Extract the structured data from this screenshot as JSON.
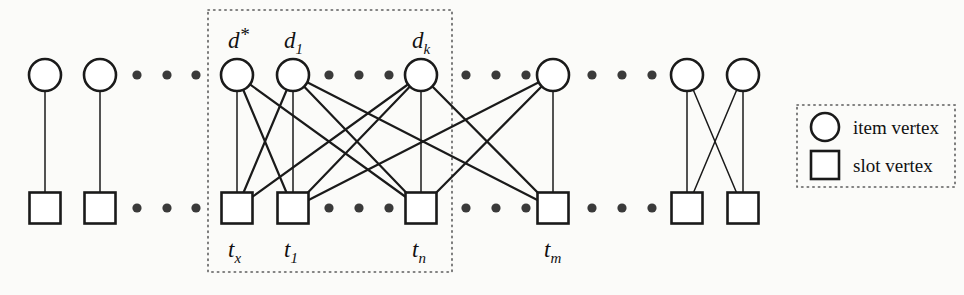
{
  "figure": {
    "kind": "bipartite-graph-diagram",
    "caption_labels": {
      "top_row_name": "item vertices",
      "bottom_row_name": "slot vertices"
    },
    "colors": {
      "background": "#fbfbf9",
      "stroke": "#1a1a1a",
      "dotted": "#5c5c5c",
      "dot_fill": "#3a3a3a",
      "vertex_fill": "#ffffff"
    }
  },
  "legend": {
    "items": [
      {
        "shape": "circle",
        "label": "item vertex"
      },
      {
        "shape": "square",
        "label": "slot vertex"
      }
    ]
  },
  "top_labels": [
    {
      "base": "d",
      "sup": "*",
      "sub": "",
      "x": 237
    },
    {
      "base": "d",
      "sup": "",
      "sub": "1",
      "x": 293
    },
    {
      "base": "d",
      "sup": "",
      "sub": "k",
      "x": 421
    }
  ],
  "bottom_labels": [
    {
      "base": "t",
      "sup": "",
      "sub": "x",
      "x": 237
    },
    {
      "base": "t",
      "sup": "",
      "sub": "1",
      "x": 293
    },
    {
      "base": "t",
      "sup": "",
      "sub": "n",
      "x": 421
    },
    {
      "base": "t",
      "sup": "",
      "sub": "m",
      "x": 553
    }
  ],
  "circles": [
    {
      "id": "c0",
      "cx": 45,
      "cy": 75,
      "r": 16
    },
    {
      "id": "c1",
      "cx": 100,
      "cy": 75,
      "r": 16
    },
    {
      "id": "c2",
      "cx": 237,
      "cy": 75,
      "r": 16
    },
    {
      "id": "c3",
      "cx": 293,
      "cy": 75,
      "r": 16
    },
    {
      "id": "c4",
      "cx": 421,
      "cy": 75,
      "r": 16
    },
    {
      "id": "c5",
      "cx": 553,
      "cy": 75,
      "r": 16
    },
    {
      "id": "c6",
      "cx": 687,
      "cy": 75,
      "r": 16
    },
    {
      "id": "c7",
      "cx": 743,
      "cy": 75,
      "r": 16
    }
  ],
  "squares": [
    {
      "id": "s0",
      "cx": 45,
      "cy": 208,
      "size": 31
    },
    {
      "id": "s1",
      "cx": 100,
      "cy": 208,
      "size": 31
    },
    {
      "id": "s2",
      "cx": 237,
      "cy": 208,
      "size": 31
    },
    {
      "id": "s3",
      "cx": 293,
      "cy": 208,
      "size": 31
    },
    {
      "id": "s4",
      "cx": 421,
      "cy": 208,
      "size": 31
    },
    {
      "id": "s5",
      "cx": 553,
      "cy": 208,
      "size": 31
    },
    {
      "id": "s6",
      "cx": 687,
      "cy": 208,
      "size": 31
    },
    {
      "id": "s7",
      "cx": 743,
      "cy": 208,
      "size": 31
    }
  ],
  "edges": [
    {
      "from": "c0",
      "to": "s0",
      "weight": "thin"
    },
    {
      "from": "c1",
      "to": "s1",
      "weight": "thin"
    },
    {
      "from": "c2",
      "to": "s2",
      "weight": "thin"
    },
    {
      "from": "c2",
      "to": "s3",
      "weight": "bold"
    },
    {
      "from": "c2",
      "to": "s4",
      "weight": "bold"
    },
    {
      "from": "c3",
      "to": "s2",
      "weight": "bold"
    },
    {
      "from": "c3",
      "to": "s3",
      "weight": "thin"
    },
    {
      "from": "c3",
      "to": "s4",
      "weight": "bold"
    },
    {
      "from": "c3",
      "to": "s5",
      "weight": "bold"
    },
    {
      "from": "c4",
      "to": "s2",
      "weight": "bold"
    },
    {
      "from": "c4",
      "to": "s3",
      "weight": "bold"
    },
    {
      "from": "c4",
      "to": "s4",
      "weight": "thin"
    },
    {
      "from": "c4",
      "to": "s5",
      "weight": "bold"
    },
    {
      "from": "c5",
      "to": "s4",
      "weight": "bold"
    },
    {
      "from": "c5",
      "to": "s5",
      "weight": "thin"
    },
    {
      "from": "c5",
      "to": "s3",
      "weight": "bold"
    },
    {
      "from": "c6",
      "to": "s6",
      "weight": "thin"
    },
    {
      "from": "c6",
      "to": "s7",
      "weight": "thin"
    },
    {
      "from": "c7",
      "to": "s6",
      "weight": "thin"
    },
    {
      "from": "c7",
      "to": "s7",
      "weight": "thin"
    }
  ],
  "ellipses": [
    {
      "row": "top",
      "y": 75,
      "xs": [
        137,
        167,
        196
      ]
    },
    {
      "row": "top",
      "y": 75,
      "xs": [
        329,
        359,
        389
      ]
    },
    {
      "row": "top",
      "y": 75,
      "xs": [
        466,
        496,
        526
      ]
    },
    {
      "row": "top",
      "y": 75,
      "xs": [
        592,
        622,
        652
      ]
    },
    {
      "row": "bottom",
      "y": 208,
      "xs": [
        137,
        167,
        196
      ]
    },
    {
      "row": "bottom",
      "y": 208,
      "xs": [
        329,
        359,
        389
      ]
    },
    {
      "row": "bottom",
      "y": 208,
      "xs": [
        466,
        496,
        526
      ]
    },
    {
      "row": "bottom",
      "y": 208,
      "xs": [
        592,
        622,
        652
      ]
    }
  ],
  "group_box": {
    "x": 208,
    "y": 10,
    "width": 244,
    "height": 262
  },
  "legend_box": {
    "x": 797,
    "y": 105,
    "width": 158,
    "height": 82
  }
}
